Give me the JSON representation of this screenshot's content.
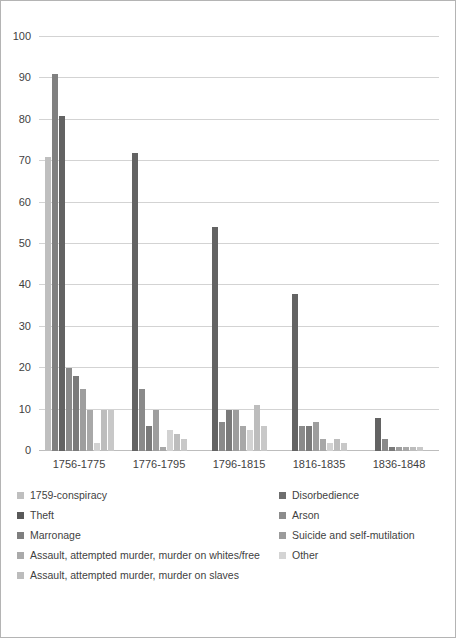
{
  "chart_data": {
    "type": "bar",
    "title": "",
    "subtitle": "",
    "xlabel": "",
    "ylabel": "",
    "grid": true,
    "legend_position": "bottom",
    "ylim": [
      0,
      100
    ],
    "yticks": [
      0,
      10,
      20,
      30,
      40,
      50,
      60,
      70,
      80,
      90,
      100
    ],
    "categories": [
      "1756-1775",
      "1776-1795",
      "1796-1815",
      "1816-1835",
      "1836-1848"
    ],
    "series": [
      {
        "name": "1759-conspiracy",
        "color": "#bfbfbf",
        "values": [
          71,
          0,
          0,
          0,
          0
        ]
      },
      {
        "name": "Disorbedience",
        "color": "#808080",
        "values": [
          91,
          0,
          0,
          0,
          0
        ]
      },
      {
        "name": "Theft",
        "color": "#636363",
        "values": [
          81,
          72,
          54,
          38,
          8
        ]
      },
      {
        "name": "Arson",
        "color": "#8a8a8a",
        "values": [
          20,
          15,
          7,
          6,
          3
        ]
      },
      {
        "name": "Marronage",
        "color": "#7a7a7a",
        "values": [
          18,
          6,
          10,
          6,
          1
        ]
      },
      {
        "name": "Suicide and self-mutilation",
        "color": "#9e9e9e",
        "values": [
          15,
          10,
          10,
          7,
          1
        ]
      },
      {
        "name": "Assault, attempted murder, murder on whites/free",
        "color": "#a8a8a8",
        "values": [
          10,
          1,
          6,
          3,
          1
        ]
      },
      {
        "name": "Other",
        "color": "#d2d2d2",
        "values": [
          2,
          5,
          5,
          2,
          0
        ]
      },
      {
        "name": "Assault, attempted murder, murder on slaves",
        "color": "#bdbdbd",
        "values": [
          10,
          4,
          11,
          3,
          1
        ]
      },
      {
        "name": "Other-trailing",
        "color": "#c8c8c8",
        "values": [
          10,
          3,
          6,
          2,
          1
        ]
      }
    ]
  },
  "legend": {
    "rows": [
      {
        "left": {
          "label": "1759-conspiracy",
          "color": "#bfbfbf"
        },
        "right": {
          "label": "Disorbedience",
          "color": "#6e6e6e"
        }
      },
      {
        "left": {
          "label": "Theft",
          "color": "#595959"
        },
        "right": {
          "label": "Arson",
          "color": "#8c8c8c"
        }
      },
      {
        "left": {
          "label": "Marronage",
          "color": "#7f7f7f"
        },
        "right": {
          "label": "Suicide and self-mutilation",
          "color": "#9b9b9b"
        }
      },
      {
        "left": {
          "label": "Assault, attempted murder, murder on whites/free",
          "color": "#aaaaaa"
        },
        "right": {
          "label": "Other",
          "color": "#d4d4d4"
        }
      },
      {
        "left": {
          "label": "Assault, attempted murder, murder on slaves",
          "color": "#bcbcbc"
        },
        "right": null
      }
    ]
  },
  "axis": {
    "y_labels": [
      "100",
      "90",
      "80",
      "70",
      "60",
      "50",
      "40",
      "30",
      "20",
      "10",
      "0"
    ],
    "x_labels": [
      "1756-1775",
      "1776-1795",
      "1796-1815",
      "1816-1835",
      "1836-1848"
    ]
  },
  "colors": {
    "gridline": "#d3d3d3",
    "border": "#b4b4b4",
    "text": "#3f3f3f",
    "background": "#ffffff"
  }
}
